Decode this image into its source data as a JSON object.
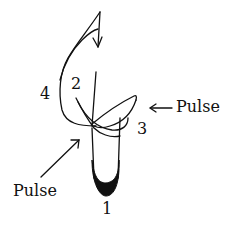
{
  "diagram": {
    "type": "conducting-pattern",
    "beats": [
      {
        "number": "1",
        "position": "bottom"
      },
      {
        "number": "2",
        "position": "upper-left-inner"
      },
      {
        "number": "3",
        "position": "right"
      },
      {
        "number": "4",
        "position": "left"
      }
    ],
    "annotations": [
      {
        "label": "Pulse",
        "arrow": "left-pointing",
        "position": "right"
      },
      {
        "label": "Pulse",
        "arrow": "up-right-pointing",
        "position": "bottom-left"
      }
    ],
    "colors": {
      "stroke": "#111111",
      "background": "#ffffff"
    }
  }
}
